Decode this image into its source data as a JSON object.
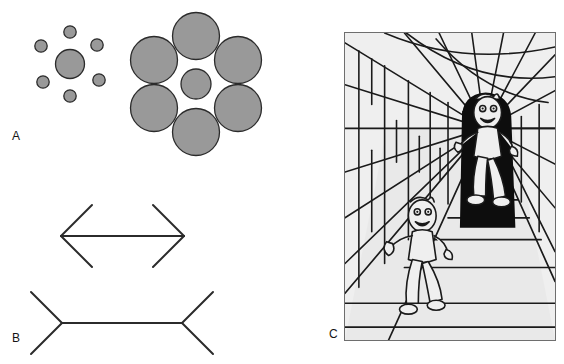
{
  "figure": {
    "background_color": "#ffffff",
    "panels": [
      {
        "id": "A",
        "label": "A",
        "name": "Ebbinghaus (Titchener circles) illusion",
        "label_x": 12,
        "label_y": 130
      },
      {
        "id": "B",
        "label": "B",
        "name": "Muller-Lyer illusion",
        "label_x": 12,
        "label_y": 332
      },
      {
        "id": "C",
        "label": "C",
        "name": "Corridor (Ponzo) illusion",
        "label_x": 329,
        "label_y": 328
      }
    ]
  },
  "colors": {
    "circle_fill": "#999999",
    "circle_stroke": "#2b2b2b",
    "line_stroke": "#2b2b2b",
    "label_text": "#141414",
    "panel_c_frame": "#6e6e6e",
    "panel_c_paper": "#efefef",
    "panel_c_ink": "#1a1a1a",
    "panel_c_shadow": "#0d0d0d"
  },
  "panel_a": {
    "stroke_width": 1.3,
    "left_cluster": {
      "name": "small-inducers-cluster",
      "center_circle": {
        "cx": 70,
        "cy": 64,
        "r": 14.5
      },
      "inducers_r": 6.2,
      "inducers": [
        {
          "cx": 70,
          "cy": 32
        },
        {
          "cx": 97,
          "cy": 45
        },
        {
          "cx": 99,
          "cy": 80
        },
        {
          "cx": 70,
          "cy": 96
        },
        {
          "cx": 43,
          "cy": 82
        },
        {
          "cx": 41,
          "cy": 46
        }
      ]
    },
    "right_cluster": {
      "name": "large-inducers-cluster",
      "center_circle": {
        "cx": 196,
        "cy": 84,
        "r": 15.0
      },
      "inducers_r": 23.5,
      "inducers": [
        {
          "cx": 196,
          "cy": 36
        },
        {
          "cx": 238,
          "cy": 60
        },
        {
          "cx": 238,
          "cy": 108
        },
        {
          "cx": 196,
          "cy": 132
        },
        {
          "cx": 154,
          "cy": 108
        },
        {
          "cx": 154,
          "cy": 60
        }
      ]
    }
  },
  "panel_b": {
    "stroke_width": 2.0,
    "arrows_in": {
      "name": "arrowheads-inward-shaft",
      "shaft": {
        "x1": 61,
        "y1": 236,
        "x2": 184,
        "y2": 236
      },
      "fins": [
        {
          "x1": 61,
          "y1": 236,
          "x2": 92,
          "y2": 205
        },
        {
          "x1": 61,
          "y1": 236,
          "x2": 92,
          "y2": 267
        },
        {
          "x1": 184,
          "y1": 236,
          "x2": 153,
          "y2": 205
        },
        {
          "x1": 184,
          "y1": 236,
          "x2": 153,
          "y2": 267
        }
      ]
    },
    "arrows_out": {
      "name": "arrowheads-outward-shaft",
      "shaft": {
        "x1": 62,
        "y1": 323,
        "x2": 182,
        "y2": 323
      },
      "fins": [
        {
          "x1": 62,
          "y1": 323,
          "x2": 31,
          "y2": 292
        },
        {
          "x1": 62,
          "y1": 323,
          "x2": 31,
          "y2": 354
        },
        {
          "x1": 182,
          "y1": 323,
          "x2": 213,
          "y2": 292
        },
        {
          "x1": 182,
          "y1": 323,
          "x2": 213,
          "y2": 354
        }
      ]
    }
  },
  "panel_c": {
    "frame": {
      "x": 344,
      "y": 32,
      "w": 212,
      "h": 309
    },
    "vanishing_point": {
      "x": 141,
      "y": 96
    },
    "scene": "two identically sized cartoon running figures in a receding brick corridor",
    "far_figure": {
      "name": "far-running-figure",
      "cx": 141,
      "cy": 128,
      "scale": 1.0
    },
    "near_figure": {
      "name": "near-running-figure",
      "cx": 75,
      "cy": 232,
      "scale": 1.0
    },
    "floor_lines_y": [
      168,
      186,
      208,
      236,
      272,
      296
    ],
    "brick_rows": 9
  }
}
